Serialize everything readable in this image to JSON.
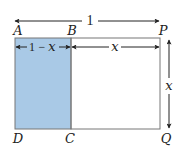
{
  "diagram": {
    "type": "geometry-rectangle",
    "colors": {
      "shaded_fill": "#a9c9e6",
      "outline": "#777777",
      "arrow": "#222222",
      "background": "#ffffff"
    },
    "vertices": {
      "A": "A",
      "B": "B",
      "P": "P",
      "D": "D",
      "C": "C",
      "Q": "Q"
    },
    "dimensions": {
      "total_width": "1",
      "shaded_width_1": "1",
      "shaded_width_minus": "−",
      "shaded_width_x": "x",
      "unshaded_width": "x",
      "height": "x"
    },
    "regions": [
      {
        "name": "ABCD",
        "shaded": true
      },
      {
        "name": "BPQC",
        "shaded": false
      }
    ]
  }
}
